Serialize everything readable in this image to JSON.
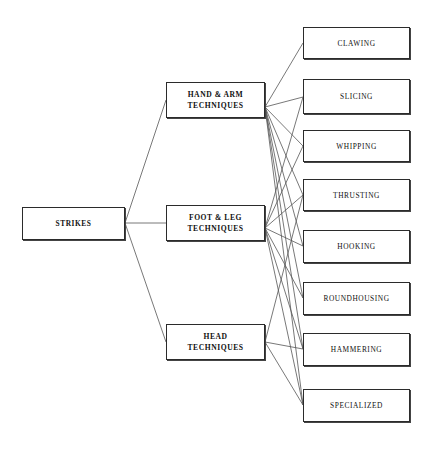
{
  "diagram": {
    "type": "tree-hierarchy",
    "orientation": "left-to-right",
    "colors": {
      "background": "#ffffff",
      "box_border": "#2b2b2b",
      "box_fill": "#ffffff",
      "connector": "#555555",
      "text": "#111111"
    },
    "root": {
      "id": "strikes",
      "label": "STRIKES",
      "x": 22,
      "y": 207,
      "width": 103,
      "height": 33
    },
    "branches": [
      {
        "id": "hand-arm",
        "label": "HAND & ARM\nTECHNIQUES",
        "x": 166,
        "y": 82,
        "width": 99,
        "height": 36
      },
      {
        "id": "foot-leg",
        "label": "FOOT & LEG\nTECHNIQUES",
        "x": 166,
        "y": 205,
        "width": 99,
        "height": 36
      },
      {
        "id": "head",
        "label": "HEAD\nTECHNIQUES",
        "x": 166,
        "y": 324,
        "width": 99,
        "height": 36
      }
    ],
    "leaves": [
      {
        "id": "clawing",
        "label": "CLAWING",
        "x": 303,
        "y": 27,
        "width": 107,
        "height": 32
      },
      {
        "id": "slicing",
        "label": "SLICING",
        "x": 303,
        "y": 79,
        "width": 107,
        "height": 35
      },
      {
        "id": "whipping",
        "label": "WHIPPING",
        "x": 303,
        "y": 130,
        "width": 107,
        "height": 32
      },
      {
        "id": "thrusting",
        "label": "THRUSTING",
        "x": 303,
        "y": 179,
        "width": 107,
        "height": 32
      },
      {
        "id": "hooking",
        "label": "HOOKING",
        "x": 303,
        "y": 230,
        "width": 107,
        "height": 33
      },
      {
        "id": "roundhousing",
        "label": "ROUNDHOUSING",
        "x": 303,
        "y": 282,
        "width": 107,
        "height": 33
      },
      {
        "id": "hammering",
        "label": "HAMMERING",
        "x": 303,
        "y": 333,
        "width": 107,
        "height": 33
      },
      {
        "id": "specialized",
        "label": "SPECIALIZED",
        "x": 303,
        "y": 389,
        "width": 107,
        "height": 33
      }
    ],
    "edges": [
      {
        "from": "strikes",
        "to": "hand-arm",
        "x1": 125,
        "y1": 223,
        "x2": 166,
        "y2": 100
      },
      {
        "from": "strikes",
        "to": "foot-leg",
        "x1": 125,
        "y1": 223,
        "x2": 166,
        "y2": 223
      },
      {
        "from": "strikes",
        "to": "head",
        "x1": 125,
        "y1": 223,
        "x2": 166,
        "y2": 342
      },
      {
        "from": "hand-arm",
        "to": "clawing",
        "x1": 265,
        "y1": 107,
        "x2": 303,
        "y2": 43
      },
      {
        "from": "hand-arm",
        "to": "slicing",
        "x1": 265,
        "y1": 107,
        "x2": 303,
        "y2": 97
      },
      {
        "from": "hand-arm",
        "to": "whipping",
        "x1": 265,
        "y1": 107,
        "x2": 303,
        "y2": 146
      },
      {
        "from": "hand-arm",
        "to": "thrusting",
        "x1": 265,
        "y1": 107,
        "x2": 303,
        "y2": 195
      },
      {
        "from": "hand-arm",
        "to": "hooking",
        "x1": 265,
        "y1": 107,
        "x2": 303,
        "y2": 246
      },
      {
        "from": "hand-arm",
        "to": "roundhousing",
        "x1": 265,
        "y1": 107,
        "x2": 303,
        "y2": 298
      },
      {
        "from": "hand-arm",
        "to": "hammering",
        "x1": 265,
        "y1": 107,
        "x2": 303,
        "y2": 349
      },
      {
        "from": "hand-arm",
        "to": "specialized",
        "x1": 265,
        "y1": 107,
        "x2": 303,
        "y2": 405
      },
      {
        "from": "foot-leg",
        "to": "slicing",
        "x1": 265,
        "y1": 228,
        "x2": 303,
        "y2": 97
      },
      {
        "from": "foot-leg",
        "to": "whipping",
        "x1": 265,
        "y1": 228,
        "x2": 303,
        "y2": 146
      },
      {
        "from": "foot-leg",
        "to": "thrusting",
        "x1": 265,
        "y1": 228,
        "x2": 303,
        "y2": 195
      },
      {
        "from": "foot-leg",
        "to": "hooking",
        "x1": 265,
        "y1": 228,
        "x2": 303,
        "y2": 246
      },
      {
        "from": "foot-leg",
        "to": "roundhousing",
        "x1": 265,
        "y1": 228,
        "x2": 303,
        "y2": 298
      },
      {
        "from": "foot-leg",
        "to": "hammering",
        "x1": 265,
        "y1": 228,
        "x2": 303,
        "y2": 349
      },
      {
        "from": "foot-leg",
        "to": "specialized",
        "x1": 265,
        "y1": 228,
        "x2": 303,
        "y2": 405
      },
      {
        "from": "head",
        "to": "thrusting",
        "x1": 265,
        "y1": 342,
        "x2": 303,
        "y2": 195
      },
      {
        "from": "head",
        "to": "hammering",
        "x1": 265,
        "y1": 342,
        "x2": 303,
        "y2": 349
      },
      {
        "from": "head",
        "to": "specialized",
        "x1": 265,
        "y1": 342,
        "x2": 303,
        "y2": 405
      }
    ]
  }
}
